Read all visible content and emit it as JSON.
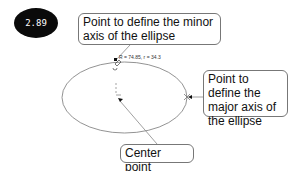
{
  "badge": {
    "label": "2.89"
  },
  "callouts": {
    "minor_axis": "Point to define the minor axis of the ellipse",
    "major_axis": "Point to define the major axis of the ellipse",
    "center": "Center point"
  },
  "dimension": {
    "text": "R = 74.85, r = 34.3"
  },
  "colors": {
    "badge_bg": "#0a0a0a",
    "line": "#888888",
    "ellipse": "#777777"
  }
}
